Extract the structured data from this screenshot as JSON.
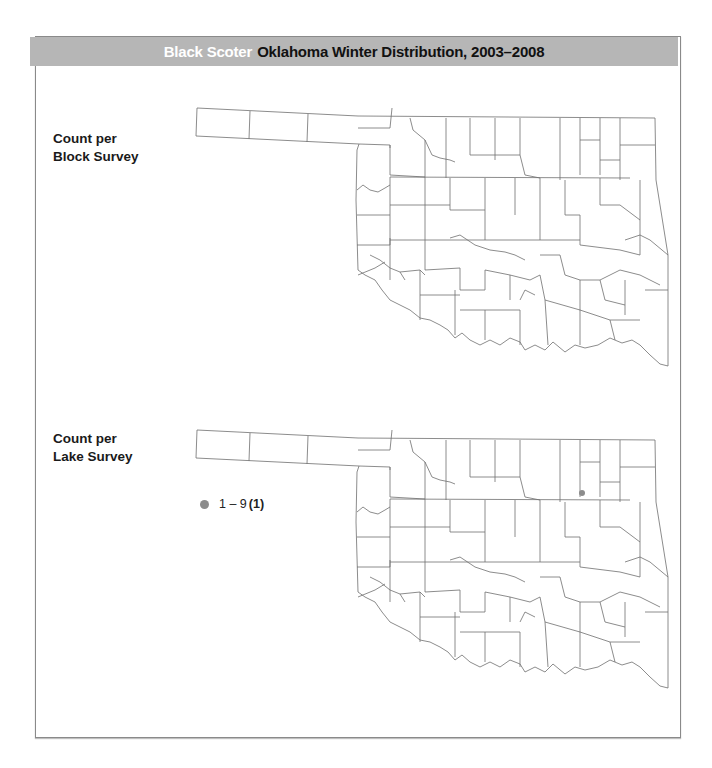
{
  "header": {
    "species": "Black Scoter",
    "title": "Oklahoma Winter Distribution, 2003–2008",
    "background_color": "#b6b6b6",
    "species_color": "#ffffff"
  },
  "panels": [
    {
      "label_line1": "Count per",
      "label_line2": "Block Survey",
      "records": []
    },
    {
      "label_line1": "Count per",
      "label_line2": "Lake Survey",
      "legend": {
        "range": "1 – 9",
        "count": "(1)",
        "dot_color": "#8c8c8c"
      },
      "records": [
        {
          "range": "1 – 9",
          "x_px": 582,
          "y_px": 493
        }
      ]
    }
  ],
  "map": {
    "region": "Oklahoma",
    "boundaries": "county",
    "line_color": "#6f6f6f"
  }
}
